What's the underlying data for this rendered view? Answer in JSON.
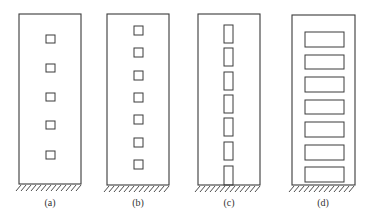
{
  "diagram": {
    "type": "shear-wall-openings",
    "stroke_color": "#3a3a3a",
    "background": "#ffffff",
    "panels": [
      {
        "id": "a",
        "label": "(a)",
        "wall": {
          "x": 19,
          "y": 14,
          "w": 62,
          "h": 170
        },
        "openings": [
          {
            "x": 46,
            "y": 35,
            "w": 9,
            "h": 8
          },
          {
            "x": 46,
            "y": 64,
            "w": 9,
            "h": 8
          },
          {
            "x": 46,
            "y": 93,
            "w": 9,
            "h": 8
          },
          {
            "x": 46,
            "y": 121,
            "w": 9,
            "h": 8
          },
          {
            "x": 46,
            "y": 151,
            "w": 9,
            "h": 8
          }
        ],
        "label_pos": {
          "x": 30,
          "y": 197
        }
      },
      {
        "id": "b",
        "label": "(b)",
        "wall": {
          "x": 107,
          "y": 14,
          "w": 62,
          "h": 171
        },
        "openings": [
          {
            "x": 134,
            "y": 26,
            "w": 9,
            "h": 9
          },
          {
            "x": 134,
            "y": 48,
            "w": 9,
            "h": 9
          },
          {
            "x": 134,
            "y": 71,
            "w": 9,
            "h": 9
          },
          {
            "x": 134,
            "y": 93,
            "w": 9,
            "h": 9
          },
          {
            "x": 134,
            "y": 115,
            "w": 9,
            "h": 9
          },
          {
            "x": 134,
            "y": 138,
            "w": 9,
            "h": 9
          },
          {
            "x": 134,
            "y": 160,
            "w": 9,
            "h": 9
          }
        ],
        "label_pos": {
          "x": 118,
          "y": 197
        }
      },
      {
        "id": "c",
        "label": "(c)",
        "wall": {
          "x": 198,
          "y": 14,
          "w": 62,
          "h": 171
        },
        "openings": [
          {
            "x": 224,
            "y": 25,
            "w": 9,
            "h": 18
          },
          {
            "x": 224,
            "y": 48,
            "w": 9,
            "h": 18
          },
          {
            "x": 224,
            "y": 72,
            "w": 9,
            "h": 18
          },
          {
            "x": 224,
            "y": 95,
            "w": 9,
            "h": 18
          },
          {
            "x": 224,
            "y": 118,
            "w": 9,
            "h": 18
          },
          {
            "x": 224,
            "y": 142,
            "w": 9,
            "h": 18
          },
          {
            "x": 224,
            "y": 166,
            "w": 9,
            "h": 19
          }
        ],
        "label_pos": {
          "x": 209,
          "y": 197
        }
      },
      {
        "id": "d",
        "label": "(d)",
        "wall": {
          "x": 292,
          "y": 15,
          "w": 63,
          "h": 170
        },
        "openings": [
          {
            "x": 305,
            "y": 32,
            "w": 39,
            "h": 15
          },
          {
            "x": 305,
            "y": 55,
            "w": 39,
            "h": 14
          },
          {
            "x": 305,
            "y": 77,
            "w": 39,
            "h": 15
          },
          {
            "x": 305,
            "y": 100,
            "w": 39,
            "h": 14
          },
          {
            "x": 305,
            "y": 122,
            "w": 39,
            "h": 15
          },
          {
            "x": 305,
            "y": 145,
            "w": 39,
            "h": 15
          },
          {
            "x": 305,
            "y": 167,
            "w": 39,
            "h": 15
          }
        ],
        "label_pos": {
          "x": 303,
          "y": 197
        }
      }
    ]
  }
}
